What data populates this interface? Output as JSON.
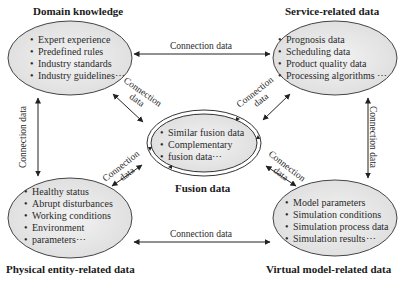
{
  "nodes": {
    "domain": {
      "title": "Domain knowledge",
      "items": [
        "Expert experience",
        "Predefined rules",
        "Industry standards",
        "Industry guidelines⋯"
      ]
    },
    "service": {
      "title": "Service-related data",
      "items": [
        "Prognosis data",
        "Scheduling data",
        "Product quality data",
        "Processing algorithms ⋯"
      ]
    },
    "fusion": {
      "title": "Fusion data",
      "items": [
        "Similar fusion data",
        "Complementary",
        "fusion data⋯"
      ]
    },
    "physical": {
      "title": "Physical entity-related data",
      "items": [
        "Healthy status",
        "Abrupt disturbances",
        "Working conditions",
        "Environment",
        "parameters⋯"
      ]
    },
    "virtual": {
      "title": "Virtual model-related data",
      "items": [
        "Model parameters",
        "Simulation conditions",
        "Simulation process data",
        "Simulation results⋯"
      ]
    }
  },
  "connections": {
    "top": "Connection data",
    "bottom": "Connection data",
    "left": "Connection data",
    "right": "Connection data",
    "diag_line1": "Connection",
    "diag_line2": "data"
  },
  "colors": {
    "ellipse_fill": "#e9e9e9",
    "stroke": "#333333"
  }
}
